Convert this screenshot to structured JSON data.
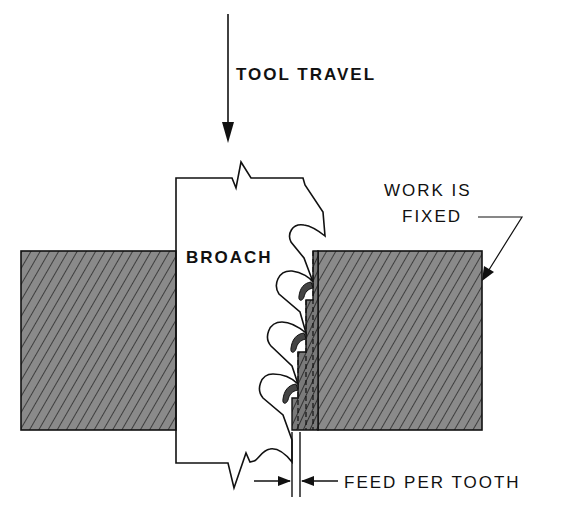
{
  "diagram": {
    "labels": {
      "tool_travel": "TOOL TRAVEL",
      "broach": "BROACH",
      "work_is": "WORK IS",
      "fixed": "FIXED",
      "feed_per_tooth": "FEED PER TOOTH"
    },
    "components": [
      {
        "name": "broach",
        "description": "cutting tool with three teeth, moving downward"
      },
      {
        "name": "workpiece-left",
        "description": "hatched fixed workpiece block, left side"
      },
      {
        "name": "workpiece-right",
        "description": "hatched fixed workpiece block, right side, being cut"
      },
      {
        "name": "chips",
        "description": "curled chips in tooth gullets"
      }
    ],
    "arrows": [
      {
        "name": "tool-travel-arrow",
        "direction": "down"
      },
      {
        "name": "work-fixed-leader",
        "direction": "down-left"
      },
      {
        "name": "feed-dimension-arrows",
        "direction": "inward"
      }
    ],
    "colors": {
      "ink": "#111111",
      "hatch_fill": "#8a8a8a",
      "background": "#ffffff"
    }
  }
}
